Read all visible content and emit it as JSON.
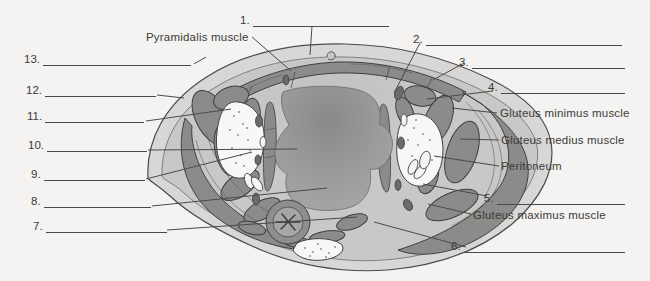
{
  "blanks": {
    "left": [
      "13.",
      "12.",
      "11.",
      "10.",
      "9.",
      "8.",
      "7."
    ],
    "right": [
      "1.",
      "2.",
      "3.",
      "4.",
      "5.",
      "6."
    ]
  },
  "named_labels": {
    "pyramidalis": "Pyramidalis muscle",
    "gluteus_minimus": "Gluteus minimus muscle",
    "gluteus_medius": "Gluteus medius muscle",
    "peritoneum": "Peritoneum",
    "gluteus_maximus": "Gluteus maximus muscle"
  },
  "colors": {
    "background": "#f4f3f1",
    "ink": "#3b3b39",
    "leader_line": "#4a4a48",
    "skin": "#d8d7d5",
    "cavity": "#c9c8c6",
    "muscle": "#8b8b89",
    "bone": "#f8f7f5",
    "organ": "#a2a19f"
  }
}
